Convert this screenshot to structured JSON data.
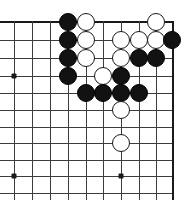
{
  "figure": {
    "kind": "go-board-diagram",
    "board": {
      "colors": {
        "background": "#ffffff",
        "line": "#3c3c3c",
        "edge_line": "#1a1a1a",
        "black_stone": "#121212",
        "white_stone": "#ffffff",
        "star_point": "#1a1a1a"
      },
      "geometry": {
        "width": 196,
        "height": 200,
        "columns_x": [
          14,
          32,
          50,
          68,
          86,
          103,
          121,
          139,
          156,
          172
        ],
        "rows_y": [
          22,
          40,
          58,
          76,
          93,
          110,
          127,
          143,
          160,
          176,
          193
        ],
        "stone_diameter": 18,
        "edge_top_index": 0,
        "edge_right_index": 9
      },
      "edges": [
        {
          "name": "top-edge",
          "orientation": "h",
          "row": 0
        },
        {
          "name": "right-edge",
          "orientation": "v",
          "col": 9
        }
      ],
      "star_points": [
        {
          "col": 0,
          "row": 3
        },
        {
          "col": 0,
          "row": 9
        },
        {
          "col": 6,
          "row": 9
        }
      ],
      "stones": [
        {
          "color": "black",
          "col": 3,
          "row": 0
        },
        {
          "color": "white",
          "col": 4,
          "row": 0
        },
        {
          "color": "white",
          "col": 8,
          "row": 0
        },
        {
          "color": "black",
          "col": 3,
          "row": 1
        },
        {
          "color": "white",
          "col": 4,
          "row": 1
        },
        {
          "color": "white",
          "col": 6,
          "row": 1
        },
        {
          "color": "white",
          "col": 7,
          "row": 1
        },
        {
          "color": "white",
          "col": 8,
          "row": 1
        },
        {
          "color": "black",
          "col": 9,
          "row": 1
        },
        {
          "color": "black",
          "col": 3,
          "row": 2
        },
        {
          "color": "white",
          "col": 4,
          "row": 2
        },
        {
          "color": "white",
          "col": 6,
          "row": 2
        },
        {
          "color": "black",
          "col": 7,
          "row": 2
        },
        {
          "color": "black",
          "col": 8,
          "row": 2
        },
        {
          "color": "black",
          "col": 3,
          "row": 3
        },
        {
          "color": "white",
          "col": 5,
          "row": 3
        },
        {
          "color": "black",
          "col": 6,
          "row": 3
        },
        {
          "color": "black",
          "col": 4,
          "row": 4
        },
        {
          "color": "black",
          "col": 5,
          "row": 4
        },
        {
          "color": "black",
          "col": 6,
          "row": 4
        },
        {
          "color": "black",
          "col": 7,
          "row": 4
        },
        {
          "color": "white",
          "col": 6,
          "row": 5
        },
        {
          "color": "white",
          "col": 6,
          "row": 7
        }
      ]
    }
  }
}
